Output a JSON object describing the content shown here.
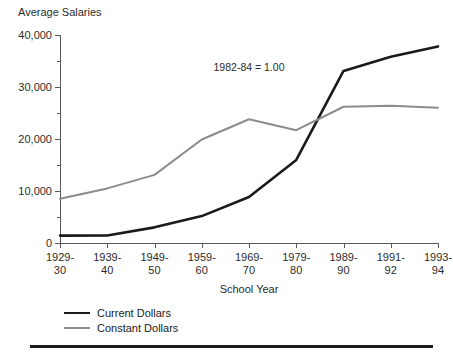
{
  "chart_data": {
    "type": "line",
    "title": "Average Salaries",
    "xlabel": "School Year",
    "ylabel": "Average Salaries",
    "annotation": "1982-84 = 1.00",
    "categories": [
      "1929-\n30",
      "1939-\n40",
      "1949-\n50",
      "1959-\n60",
      "1969-\n70",
      "1979-\n80",
      "1989-\n90",
      "1991-\n92",
      "1993-\n94"
    ],
    "category_lines": [
      [
        "1929-",
        "30"
      ],
      [
        "1939-",
        "40"
      ],
      [
        "1949-",
        "50"
      ],
      [
        "1959-",
        "60"
      ],
      [
        "1969-",
        "70"
      ],
      [
        "1979-",
        "80"
      ],
      [
        "1989-",
        "90"
      ],
      [
        "1991-",
        "92"
      ],
      [
        "1993-",
        "94"
      ]
    ],
    "series": [
      {
        "name": "Current Dollars",
        "color": "#1a1a1a",
        "values": [
          1420,
          1441,
          3010,
          5174,
          8840,
          15970,
          33100,
          35800,
          37800
        ]
      },
      {
        "name": "Constant Dollars",
        "color": "#8c8c8c",
        "values": [
          8500,
          10500,
          13100,
          19900,
          23800,
          21700,
          26200,
          26400,
          26000
        ]
      }
    ],
    "ylim": [
      0,
      40000
    ],
    "ytick_values": [
      0,
      10000,
      20000,
      30000,
      40000
    ],
    "ytick_labels": [
      "0",
      "10,000",
      "20,000",
      "30,000",
      "40,000"
    ],
    "yminor_values": [
      5000,
      15000,
      25000,
      35000
    ],
    "grid": false,
    "legend_position": "bottom-left"
  }
}
